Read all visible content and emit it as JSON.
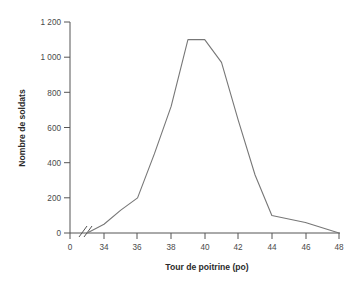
{
  "chart_data": {
    "type": "line",
    "title": "TOUR DE POITRINE DES SOLDATS",
    "xlabel": "Tour de poitrine (po)",
    "ylabel": "Nombre de soldats",
    "x": [
      33,
      34,
      35,
      36,
      37,
      38,
      39,
      40,
      41,
      42,
      43,
      44,
      46,
      48
    ],
    "values": [
      0,
      50,
      130,
      200,
      450,
      720,
      1100,
      1100,
      970,
      640,
      330,
      100,
      60,
      0
    ],
    "series": [
      {
        "name": "Nombre de soldats",
        "values": [
          0,
          50,
          130,
          200,
          450,
          720,
          1100,
          1100,
          970,
          640,
          330,
          100,
          60,
          0
        ]
      }
    ],
    "xlim": [
      33,
      48
    ],
    "ylim": [
      0,
      1200
    ],
    "xticks": [
      "0",
      "34",
      "36",
      "38",
      "40",
      "42",
      "44",
      "46",
      "48"
    ],
    "xtick_values": [
      0,
      34,
      36,
      38,
      40,
      42,
      44,
      46,
      48
    ],
    "yticks": [
      "0",
      "200",
      "400",
      "600",
      "800",
      "1 000",
      "1 200"
    ],
    "ytick_values": [
      0,
      200,
      400,
      600,
      800,
      1000,
      1200
    ],
    "grid": false,
    "legend": null,
    "axis_break": "//",
    "line_color": "#777777",
    "axis_color": "#555555"
  },
  "axes": {
    "x_title": "Tour de poitrine (po)",
    "y_title": "Nombre de soldats"
  },
  "ticks": {
    "x": [
      {
        "label": "0"
      },
      {
        "label": "34"
      },
      {
        "label": "36"
      },
      {
        "label": "38"
      },
      {
        "label": "40"
      },
      {
        "label": "42"
      },
      {
        "label": "44"
      },
      {
        "label": "46"
      },
      {
        "label": "48"
      }
    ],
    "y": [
      {
        "label": "0"
      },
      {
        "label": "200"
      },
      {
        "label": "400"
      },
      {
        "label": "600"
      },
      {
        "label": "800"
      },
      {
        "label": "1 000"
      },
      {
        "label": "1 200"
      }
    ]
  }
}
